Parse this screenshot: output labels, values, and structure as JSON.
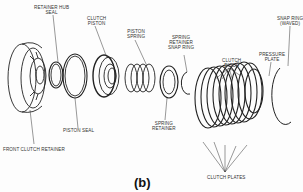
{
  "figure": {
    "caption": "(b)",
    "labels": {
      "retainer_hub_seal": "RETAINER HUB\nSEAL",
      "clutch_piston": "CLUTCH\nPISTON",
      "piston_spring": "PISTON\nSPRING",
      "spring_retainer_snap_ring": "SPRING\nRETAINER\nSNAP RING",
      "clutch_discs": "CLUTCH\nDISCS",
      "pressure_plate": "PRESSURE\nPLATE",
      "snap_ring_waved": "SNAP RING\n(WAVED)",
      "piston_seal": "PISTON SEAL",
      "front_clutch_retainer": "FRONT CLUTCH RETAINER",
      "spring_retainer": "SPRING\nRETAINER",
      "clutch_plates": "CLUTCH PLATES"
    }
  }
}
